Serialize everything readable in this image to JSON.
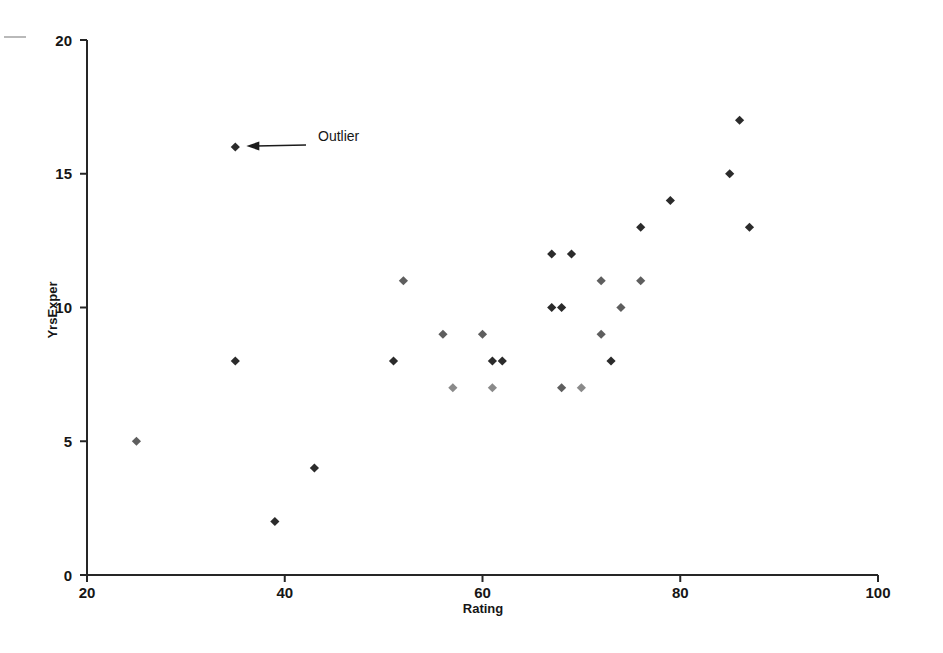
{
  "figure": {
    "background_color": "#ffffff",
    "marker_color": "#2b2b2b",
    "axis_color": "#262626"
  },
  "annotations": [
    {
      "text": "Outlier",
      "points_to_x": 35,
      "points_to_y": 16,
      "label_x": 318,
      "label_y": 141
    }
  ],
  "chart_data": {
    "type": "scatter",
    "title": "",
    "xlabel": "Rating",
    "ylabel": "YrsExper",
    "xlim": [
      20,
      100
    ],
    "ylim": [
      0,
      20
    ],
    "xticks": [
      20,
      40,
      60,
      80,
      100
    ],
    "yticks": [
      0,
      5,
      10,
      15,
      20
    ],
    "grid": false,
    "legend": false,
    "marker": "diamond",
    "points": [
      {
        "x": 25,
        "y": 5,
        "shade": "mid"
      },
      {
        "x": 35,
        "y": 16,
        "shade": "dark",
        "note": "Outlier"
      },
      {
        "x": 35,
        "y": 8,
        "shade": "dark"
      },
      {
        "x": 39,
        "y": 2,
        "shade": "dark"
      },
      {
        "x": 43,
        "y": 4,
        "shade": "dark"
      },
      {
        "x": 51,
        "y": 8,
        "shade": "dark"
      },
      {
        "x": 52,
        "y": 11,
        "shade": "mid"
      },
      {
        "x": 56,
        "y": 9,
        "shade": "mid"
      },
      {
        "x": 57,
        "y": 7,
        "shade": "light"
      },
      {
        "x": 60,
        "y": 9,
        "shade": "mid"
      },
      {
        "x": 61,
        "y": 7,
        "shade": "light"
      },
      {
        "x": 61,
        "y": 8,
        "shade": "dark"
      },
      {
        "x": 62,
        "y": 8,
        "shade": "dark"
      },
      {
        "x": 67,
        "y": 10,
        "shade": "dark"
      },
      {
        "x": 68,
        "y": 10,
        "shade": "dark"
      },
      {
        "x": 67,
        "y": 12,
        "shade": "dark"
      },
      {
        "x": 69,
        "y": 12,
        "shade": "dark"
      },
      {
        "x": 68,
        "y": 7,
        "shade": "mid"
      },
      {
        "x": 70,
        "y": 7,
        "shade": "light"
      },
      {
        "x": 72,
        "y": 11,
        "shade": "mid"
      },
      {
        "x": 72,
        "y": 9,
        "shade": "mid"
      },
      {
        "x": 73,
        "y": 8,
        "shade": "dark"
      },
      {
        "x": 74,
        "y": 10,
        "shade": "mid"
      },
      {
        "x": 76,
        "y": 11,
        "shade": "mid"
      },
      {
        "x": 76,
        "y": 13,
        "shade": "dark"
      },
      {
        "x": 79,
        "y": 14,
        "shade": "dark"
      },
      {
        "x": 85,
        "y": 15,
        "shade": "dark"
      },
      {
        "x": 86,
        "y": 17,
        "shade": "dark"
      },
      {
        "x": 87,
        "y": 13,
        "shade": "dark"
      }
    ]
  }
}
